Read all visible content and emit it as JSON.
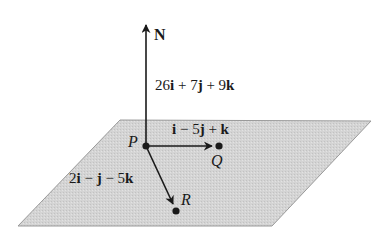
{
  "diagram": {
    "type": "vector-plane",
    "plane": {
      "fill": "#d6d6d6",
      "stroke": "#9a9a9a",
      "corners": [
        [
          120,
          120
        ],
        [
          371,
          121
        ],
        [
          272,
          226
        ],
        [
          18,
          226
        ]
      ]
    },
    "points": [
      {
        "name": "P",
        "x": 146,
        "y": 146
      },
      {
        "name": "Q",
        "x": 219,
        "y": 146
      },
      {
        "name": "R",
        "x": 176,
        "y": 211
      }
    ],
    "normal": {
      "label": "N",
      "expression": "26i + 7j + 9k",
      "expr_parts": [
        "26",
        "i",
        " + 7",
        "j",
        " + 9",
        "k"
      ]
    },
    "vector_PQ": {
      "expression": "i − 5j + k",
      "expr_parts": [
        "",
        "i",
        " − 5",
        "j",
        " + ",
        "k"
      ]
    },
    "vector_PR": {
      "expression": "2i − j − 5k",
      "expr_parts": [
        "2",
        "i",
        " − ",
        "j",
        " − 5",
        "k"
      ]
    },
    "colors": {
      "line": "#1a1a1a",
      "text": "#1a1a1a"
    }
  }
}
